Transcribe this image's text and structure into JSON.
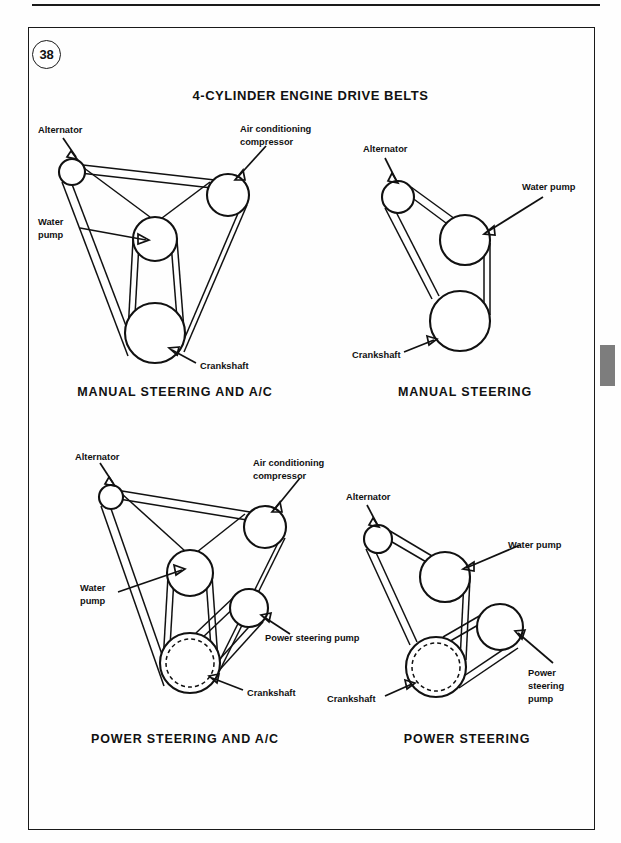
{
  "page": {
    "number_badge": "38",
    "sheet_title": "4-CYLINDER ENGINE DRIVE BELTS",
    "edge_tab_color": "#7d7d7d",
    "ink_color": "#111111"
  },
  "labels": {
    "alternator": "Alternator",
    "water_pump": "Water pump",
    "water_pump_l1": "Water",
    "water_pump_l2": "pump",
    "crankshaft": "Crankshaft",
    "ac_l1": "Air conditioning",
    "ac_l2": "compressor",
    "power_steering_pump": "Power steering pump",
    "ps_l1": "Power",
    "ps_l2": "steering",
    "ps_l3": "pump"
  },
  "diagrams": [
    {
      "id": "manual-steering-and-ac",
      "caption": "MANUAL STEERING AND A/C",
      "pulleys": [
        {
          "name": "alternator",
          "cx": 72,
          "cy": 172,
          "r": 13,
          "dashed": false
        },
        {
          "name": "ac-compressor",
          "cx": 228,
          "cy": 195,
          "r": 21,
          "dashed": false
        },
        {
          "name": "water-pump",
          "cx": 155,
          "cy": 239,
          "r": 22,
          "dashed": false
        },
        {
          "name": "crankshaft",
          "cx": 155,
          "cy": 333,
          "r": 30,
          "dashed": false
        }
      ],
      "callouts": [
        "Alternator",
        "Air conditioning compressor",
        "Water pump",
        "Crankshaft"
      ]
    },
    {
      "id": "manual-steering",
      "caption": "MANUAL STEERING",
      "pulleys": [
        {
          "name": "alternator",
          "cx": 398,
          "cy": 197,
          "r": 16,
          "dashed": false
        },
        {
          "name": "water-pump",
          "cx": 465,
          "cy": 240,
          "r": 25,
          "dashed": false
        },
        {
          "name": "crankshaft",
          "cx": 460,
          "cy": 321,
          "r": 30,
          "dashed": false
        }
      ],
      "callouts": [
        "Alternator",
        "Water pump",
        "Crankshaft"
      ]
    },
    {
      "id": "power-steering-and-ac",
      "caption": "POWER STEERING AND A/C",
      "pulleys": [
        {
          "name": "alternator",
          "cx": 111,
          "cy": 497,
          "r": 12,
          "dashed": false
        },
        {
          "name": "ac-compressor",
          "cx": 265,
          "cy": 527,
          "r": 21,
          "dashed": false
        },
        {
          "name": "water-pump",
          "cx": 190,
          "cy": 573,
          "r": 23,
          "dashed": false
        },
        {
          "name": "power-steering-pump",
          "cx": 249,
          "cy": 608,
          "r": 19,
          "dashed": false
        },
        {
          "name": "crankshaft",
          "cx": 190,
          "cy": 663,
          "r": 30,
          "dashed": true
        }
      ],
      "callouts": [
        "Alternator",
        "Air conditioning compressor",
        "Water pump",
        "Power steering pump",
        "Crankshaft"
      ]
    },
    {
      "id": "power-steering",
      "caption": "POWER STEERING",
      "pulleys": [
        {
          "name": "alternator",
          "cx": 378,
          "cy": 539,
          "r": 14,
          "dashed": false
        },
        {
          "name": "water-pump",
          "cx": 445,
          "cy": 577,
          "r": 25,
          "dashed": false
        },
        {
          "name": "power-steering-pump",
          "cx": 500,
          "cy": 627,
          "r": 23,
          "dashed": false
        },
        {
          "name": "crankshaft",
          "cx": 436,
          "cy": 667,
          "r": 30,
          "dashed": true
        }
      ],
      "callouts": [
        "Alternator",
        "Water pump",
        "Power steering pump",
        "Crankshaft"
      ]
    }
  ]
}
